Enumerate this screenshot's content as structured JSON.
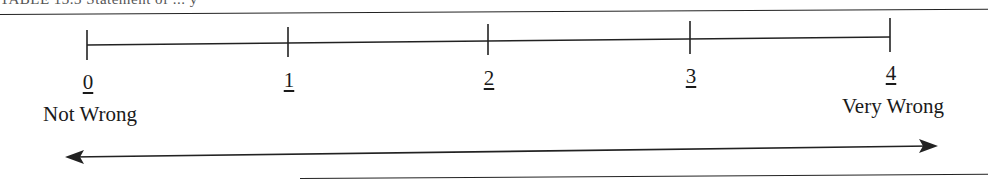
{
  "caption": "TABLE 13.3  Statement of ... y",
  "scale": {
    "ticks": [
      {
        "value": "0",
        "x": 87
      },
      {
        "value": "1",
        "x": 288
      },
      {
        "value": "2",
        "x": 488
      },
      {
        "value": "3",
        "x": 690
      },
      {
        "value": "4",
        "x": 890
      }
    ],
    "left_anchor": "Not Wrong",
    "right_anchor": "Very Wrong"
  },
  "arrow": {
    "type": "double-headed",
    "from_x": 65,
    "to_x": 938
  }
}
